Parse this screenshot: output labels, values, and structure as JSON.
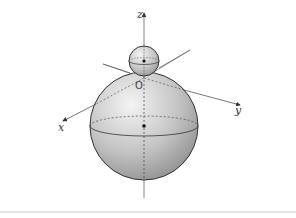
{
  "figure": {
    "labels": {
      "z_axis": "z",
      "x_axis": "x",
      "y_axis": "y",
      "origin": "O"
    },
    "colors": {
      "axis": "#555555",
      "sphere_outline": "#333333",
      "sphere_fill_light": "#eeeeee",
      "sphere_fill_dark": "#8f8f8f",
      "center_dot": "#111111",
      "separator": "#cccccc"
    },
    "small_sphere": {
      "cx": 144,
      "cy": 61,
      "r": 15
    },
    "large_sphere": {
      "cx": 144,
      "cy": 126,
      "r": 54
    }
  }
}
